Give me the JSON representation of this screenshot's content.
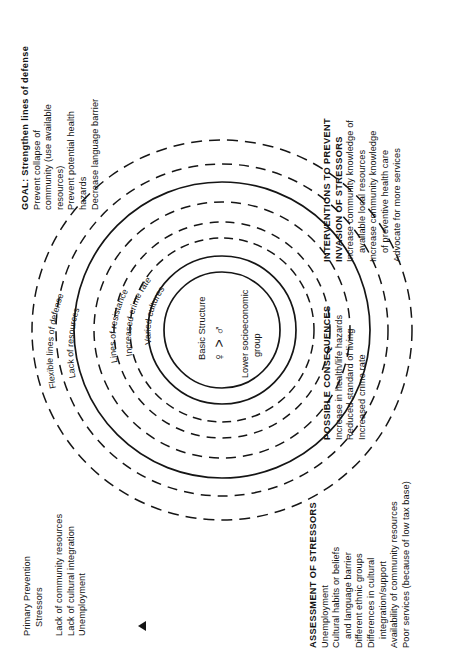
{
  "figure": {
    "marker": "▲",
    "orientation": "rotated-90"
  },
  "blocks": {
    "goal": {
      "lines": [
        "GOAL: Strengthen lines of defense",
        "Prevent collapse of",
        "community (use available",
        "resources)",
        "Prevent potential health",
        "hazards",
        "Decrease language barrier"
      ]
    },
    "primary_prevention": {
      "lines": [
        "Primary Prevention",
        "Stressors",
        "",
        "Lack of community resources",
        "Lack of cultural integration",
        "Unemployment"
      ]
    },
    "interventions": {
      "lines": [
        "INTERVENTIONS TO PREVENT",
        "INVASION OF STRESSORS",
        "Increase community knowledge of",
        "available local resources",
        "Increase community knowledge",
        "of preventive health care",
        "Advocate for more services"
      ]
    },
    "consequences": {
      "lines": [
        "POSSIBLE CONSEQUENCES",
        "Increase in health/life hazards",
        "Reduced standard of living",
        "Increased crime rate"
      ]
    },
    "assessment": {
      "lines": [
        "ASSESSMENT OF STRESSORS",
        "Unemployment",
        "Cultural habits or beliefs",
        "and language barrier",
        "Different ethnic groups",
        "Differences in cultural",
        "integration/support",
        "Availability of community resources",
        "Poor services (because of low tax base)"
      ]
    }
  },
  "rings": {
    "flexible_lines_of_defense": "Flexible lines of defense",
    "lack_of_resources": "Lack of resources",
    "lines_of_resistance": "Lines of resistance",
    "increased_crime_rate": "Increased crime rate",
    "varied_cultures": "Varied cultures"
  },
  "core": {
    "basic_structure": "Basic Structure",
    "gender_ratio": "♀ > ♂",
    "socioeconomic": "Lower socioeconomic",
    "socioeconomic2": "group"
  },
  "colors": {
    "ink": "#131313",
    "paper": "#ffffff"
  }
}
